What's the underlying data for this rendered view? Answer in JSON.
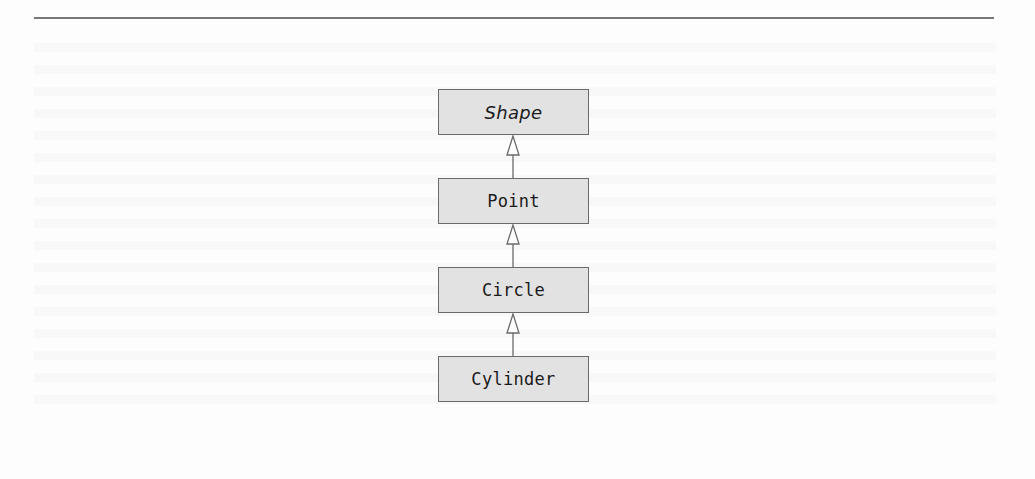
{
  "diagram": {
    "type": "uml-class-hierarchy",
    "relationship": "generalization",
    "colors": {
      "box_fill": "#e2e2e2",
      "box_border": "#6a6a6a",
      "connector": "#6a6a6a",
      "rule": "#777777",
      "background": "#fdfdfd"
    },
    "classes": [
      {
        "name": "Shape",
        "abstract": true
      },
      {
        "name": "Point",
        "abstract": false
      },
      {
        "name": "Circle",
        "abstract": false
      },
      {
        "name": "Cylinder",
        "abstract": false
      }
    ],
    "edges": [
      {
        "from": "Point",
        "to": "Shape",
        "arrow": "hollow-triangle-icon"
      },
      {
        "from": "Circle",
        "to": "Point",
        "arrow": "hollow-triangle-icon"
      },
      {
        "from": "Cylinder",
        "to": "Circle",
        "arrow": "hollow-triangle-icon"
      }
    ]
  }
}
